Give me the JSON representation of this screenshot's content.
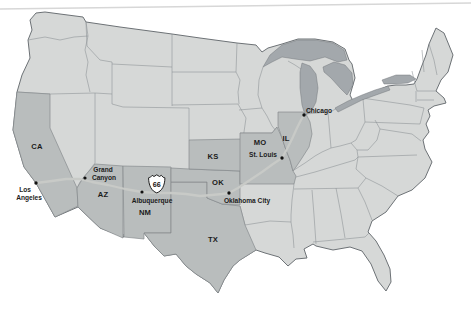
{
  "map": {
    "description": "Route 66 map of the United States",
    "colors": {
      "background": "#ffffff",
      "state_fill": "#d6d8d7",
      "highlight_fill": "#b9bdbd",
      "lake_fill": "#a3a8ac",
      "border_stroke": "#8a8f92",
      "outline_stroke": "#6d7276",
      "route_stroke": "#c8cac7",
      "label_color": "#1b1b1b"
    },
    "route": {
      "shield": "66"
    },
    "states": {
      "ca": "CA",
      "az": "AZ",
      "nm": "NM",
      "tx": "TX",
      "ok": "OK",
      "ks": "KS",
      "mo": "MO",
      "il": "IL"
    },
    "cities": {
      "los_angeles_line1": "Los",
      "los_angeles_line2": "Angeles",
      "grand_canyon_line1": "Grand",
      "grand_canyon_line2": "Canyon",
      "albuquerque": "Albuquerque",
      "oklahoma_city": "Oklahoma City",
      "st_louis": "St. Louis",
      "chicago": "Chicago"
    }
  }
}
